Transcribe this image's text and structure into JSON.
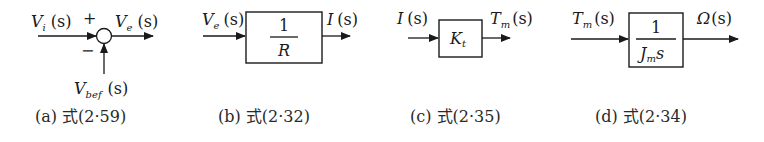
{
  "diagrams": [
    {
      "id": "a",
      "type": "summing-junction",
      "input_label": "V",
      "input_sub": "i",
      "input_arg": "(s)",
      "plus_sign": "+",
      "minus_sign": "−",
      "output_label": "V",
      "output_sub": "e",
      "output_arg": "(s)",
      "feedback_label": "V",
      "feedback_sub": "bef",
      "feedback_arg": "(s)",
      "caption": "(a) 式(2·59)"
    },
    {
      "id": "b",
      "type": "block",
      "input_label": "V",
      "input_sub": "e",
      "input_arg": "(s)",
      "block_numerator": "1",
      "block_denominator": "R",
      "output_label": "I",
      "output_arg": "(s)",
      "caption": "(b) 式(2·32)"
    },
    {
      "id": "c",
      "type": "block",
      "input_label": "I",
      "input_arg": "(s)",
      "block_label": "K",
      "block_sub": "t",
      "output_label": "T",
      "output_sub": "m",
      "output_arg": "(s)",
      "caption": "(c) 式(2·35)"
    },
    {
      "id": "d",
      "type": "block",
      "input_label": "T",
      "input_sub": "m",
      "input_arg": "(s)",
      "block_numerator": "1",
      "block_denominator_main": "J",
      "block_denominator_sub": "m",
      "block_denominator_tail": "s",
      "output_label": "Ω",
      "output_arg": "(s)",
      "caption": "(d) 式(2·34)"
    }
  ]
}
